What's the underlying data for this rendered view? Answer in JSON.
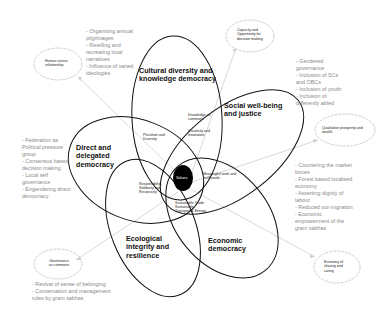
{
  "center": {
    "label": "Values"
  },
  "petals": [
    {
      "id": "cultural",
      "title": "Cultural diversity and knowledge democracy"
    },
    {
      "id": "social",
      "title": "Social well-being and justice"
    },
    {
      "id": "direct",
      "title": "Direct and delegated democracy"
    },
    {
      "id": "ecological",
      "title": "Ecological integrity and resilience"
    },
    {
      "id": "economic",
      "title": "Economic democracy"
    }
  ],
  "overlaps": {
    "pluralism": "Pluralism and Diversity",
    "knowledge_commons": "Knowledge as commons",
    "creativity": "Creativity and Innovation",
    "meaningful_work": "Meaningful work and livelihoods",
    "responsibility": "Responsibility, Solidarity and Reciprocity",
    "sustainable_trade": "Sustainable Trade Sustainable Transport & Energy"
  },
  "bubbles": {
    "human_nature": "Human nature relationship",
    "capacity": "Capacity and Opportunity for decision making",
    "qualitative": "Qualitative prosperity and wealth",
    "governance_commons": "Governance as commons",
    "economy_sharing": "Economy of sharing and caring"
  },
  "bullet_lists": {
    "cultural": [
      "- Organising annual pilgrimages",
      "- Retelling and recreating local narratives",
      "- Influence of varied ideologies"
    ],
    "social": [
      "- Gendered governance",
      "- Inclusion of SCs and OBCs",
      "- Inclusion of youth",
      "- Inclusion of differently abled"
    ],
    "direct": [
      "- Federation as Political pressure group",
      "- Consensus based decision making",
      "- Local self governance",
      "- Engendering direct democracy"
    ],
    "economic": [
      "- Countering the market forces",
      "- Forest based localised economy",
      "- Asserting dignity of labour",
      "- Reduced out-migration",
      "- Economic empowerment of the gram sabhas"
    ],
    "ecological": [
      "- Revival of sense of belonging",
      "- Conservation and management rules by gram sabhas"
    ]
  },
  "colors": {
    "outline": "#111111",
    "bubble_outline": "#c8c8c8",
    "connector": "#cfcfcf",
    "bullet_text": "#8a8a8a",
    "center_fill": "#000000"
  }
}
